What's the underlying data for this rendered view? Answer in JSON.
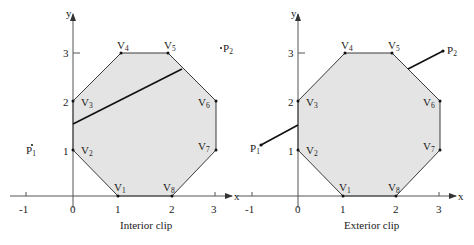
{
  "figures": [
    {
      "id": "interior",
      "caption": "Interior clip",
      "axis_x_label": "x",
      "axis_y_label": "y",
      "x_ticks": [
        "-1",
        "0",
        "1",
        "2",
        "3"
      ],
      "y_ticks": [
        "1",
        "2",
        "3"
      ],
      "vertices": [
        {
          "name": "V",
          "sub": "1",
          "coord": [
            1,
            0
          ]
        },
        {
          "name": "V",
          "sub": "2",
          "coord": [
            0,
            1
          ]
        },
        {
          "name": "V",
          "sub": "3",
          "coord": [
            0,
            2
          ]
        },
        {
          "name": "V",
          "sub": "4",
          "coord": [
            1,
            3
          ]
        },
        {
          "name": "V",
          "sub": "5",
          "coord": [
            2,
            3
          ]
        },
        {
          "name": "V",
          "sub": "6",
          "coord": [
            3,
            2
          ]
        },
        {
          "name": "V",
          "sub": "7",
          "coord": [
            3,
            1
          ]
        },
        {
          "name": "V",
          "sub": "8",
          "coord": [
            2,
            0
          ]
        }
      ],
      "points": [
        {
          "name": "P",
          "sub": "1",
          "coord": [
            -0.8,
            1.15
          ]
        },
        {
          "name": "P",
          "sub": "2",
          "coord": [
            3.1,
            3.05
          ]
        }
      ],
      "visible_segment": "inside polygon"
    },
    {
      "id": "exterior",
      "caption": "Exterior clip",
      "axis_x_label": "x",
      "axis_y_label": "y",
      "x_ticks": [
        "-1",
        "0",
        "1",
        "2",
        "3"
      ],
      "y_ticks": [
        "1",
        "2",
        "3"
      ],
      "vertices": [
        {
          "name": "V",
          "sub": "1",
          "coord": [
            1,
            0
          ]
        },
        {
          "name": "V",
          "sub": "2",
          "coord": [
            0,
            1
          ]
        },
        {
          "name": "V",
          "sub": "3",
          "coord": [
            0,
            2
          ]
        },
        {
          "name": "V",
          "sub": "4",
          "coord": [
            1,
            3
          ]
        },
        {
          "name": "V",
          "sub": "5",
          "coord": [
            2,
            3
          ]
        },
        {
          "name": "V",
          "sub": "6",
          "coord": [
            3,
            2
          ]
        },
        {
          "name": "V",
          "sub": "7",
          "coord": [
            3,
            1
          ]
        },
        {
          "name": "V",
          "sub": "8",
          "coord": [
            2,
            0
          ]
        }
      ],
      "points": [
        {
          "name": "P",
          "sub": "1",
          "coord": [
            -0.8,
            1.15
          ]
        },
        {
          "name": "P",
          "sub": "2",
          "coord": [
            3.1,
            3.05
          ]
        }
      ],
      "visible_segment": "outside polygon"
    }
  ],
  "colors": {
    "polygon_fill": "#e4e4e4",
    "polygon_stroke": "#3a3a3a",
    "line": "#111111",
    "axis": "#555555"
  }
}
